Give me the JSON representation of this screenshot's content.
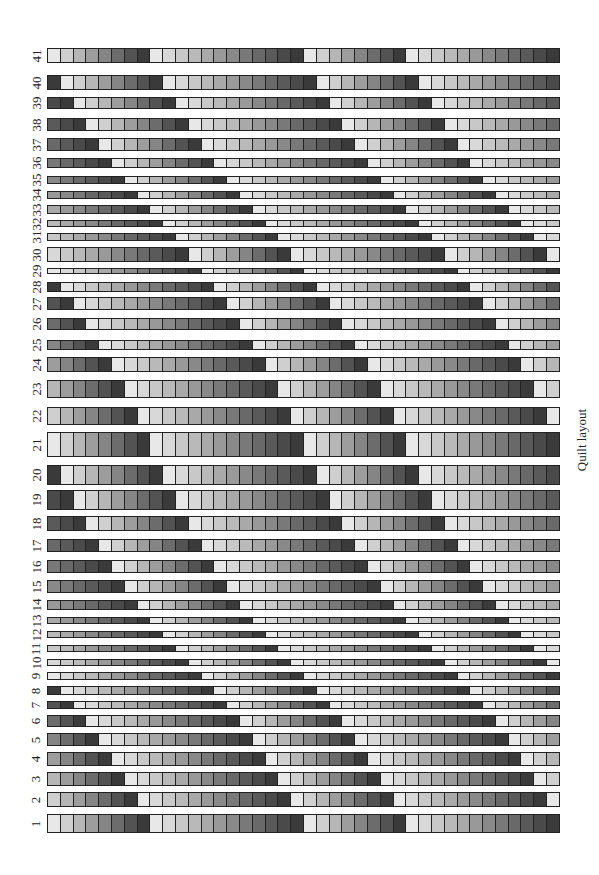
{
  "chart_data": {
    "type": "heatmap",
    "title": "Quilt layout",
    "xlabel": "",
    "ylabel": "",
    "columns": 40,
    "block_lengths": [
      8,
      12,
      8,
      12
    ],
    "grayscale_range": [
      "#e8e8e8",
      "#3a3a3a"
    ],
    "rule": "Row r uses the base sequence rotated right by (41 - r) cells",
    "rows": [
      {
        "label": "41",
        "top": 48,
        "height": 15
      },
      {
        "label": "40",
        "top": 75,
        "height": 15
      },
      {
        "label": "39",
        "top": 97,
        "height": 12
      },
      {
        "label": "38",
        "top": 118,
        "height": 13
      },
      {
        "label": "37",
        "top": 138,
        "height": 13
      },
      {
        "label": "36",
        "top": 158,
        "height": 10
      },
      {
        "label": "35",
        "top": 176,
        "height": 8
      },
      {
        "label": "34",
        "top": 191,
        "height": 8
      },
      {
        "label": "33",
        "top": 205,
        "height": 9
      },
      {
        "label": "32",
        "top": 220,
        "height": 7
      },
      {
        "label": "31",
        "top": 233,
        "height": 8
      },
      {
        "label": "30",
        "top": 247,
        "height": 15
      },
      {
        "label": "29",
        "top": 268,
        "height": 6
      },
      {
        "label": "28",
        "top": 282,
        "height": 10
      },
      {
        "label": "27",
        "top": 297,
        "height": 13
      },
      {
        "label": "26",
        "top": 318,
        "height": 12
      },
      {
        "label": "25",
        "top": 340,
        "height": 10
      },
      {
        "label": "24",
        "top": 357,
        "height": 15
      },
      {
        "label": "23",
        "top": 380,
        "height": 18
      },
      {
        "label": "22",
        "top": 407,
        "height": 18
      },
      {
        "label": "21",
        "top": 432,
        "height": 25
      },
      {
        "label": "20",
        "top": 465,
        "height": 20
      },
      {
        "label": "19",
        "top": 490,
        "height": 20
      },
      {
        "label": "18",
        "top": 516,
        "height": 15
      },
      {
        "label": "17",
        "top": 539,
        "height": 13
      },
      {
        "label": "16",
        "top": 560,
        "height": 13
      },
      {
        "label": "15",
        "top": 580,
        "height": 13
      },
      {
        "label": "14",
        "top": 600,
        "height": 10
      },
      {
        "label": "13",
        "top": 617,
        "height": 7
      },
      {
        "label": "12",
        "top": 631,
        "height": 7
      },
      {
        "label": "11",
        "top": 645,
        "height": 7
      },
      {
        "label": "10",
        "top": 659,
        "height": 7
      },
      {
        "label": "9",
        "top": 672,
        "height": 8
      },
      {
        "label": "8",
        "top": 686,
        "height": 9
      },
      {
        "label": "7",
        "top": 701,
        "height": 8
      },
      {
        "label": "6",
        "top": 715,
        "height": 12
      },
      {
        "label": "5",
        "top": 733,
        "height": 13
      },
      {
        "label": "4",
        "top": 752,
        "height": 14
      },
      {
        "label": "3",
        "top": 772,
        "height": 14
      },
      {
        "label": "2",
        "top": 792,
        "height": 15
      },
      {
        "label": "1",
        "top": 814,
        "height": 19
      }
    ]
  },
  "side_title": "Quilt layout"
}
